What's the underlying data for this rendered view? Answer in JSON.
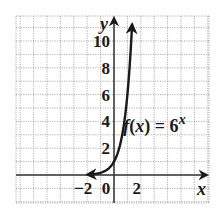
{
  "chart_data": {
    "type": "line",
    "title": "",
    "xlabel": "x",
    "ylabel": "y",
    "xlim": [
      -7.3,
      7.1
    ],
    "ylim": [
      -2.1,
      11.9
    ],
    "grid": true,
    "x_ticks": [
      {
        "value": -2,
        "label": "−2"
      },
      {
        "value": 0,
        "label": "0"
      },
      {
        "value": 2,
        "label": "2"
      }
    ],
    "y_ticks": [
      {
        "value": 2,
        "label": "2"
      },
      {
        "value": 4,
        "label": "4"
      },
      {
        "value": 6,
        "label": "6"
      },
      {
        "value": 8,
        "label": "8"
      },
      {
        "value": 10,
        "label": "10"
      }
    ],
    "series": [
      {
        "name": "f(x) = 6^x",
        "function": "6^x",
        "x": [
          -2,
          -1.5,
          -1,
          -0.5,
          0,
          0.25,
          0.5,
          0.75,
          1,
          1.1,
          1.2,
          1.3,
          1.35
        ],
        "y": [
          0.028,
          0.068,
          0.167,
          0.408,
          1,
          1.565,
          2.449,
          3.834,
          6,
          7.18,
          8.59,
          10.27,
          11.24
        ],
        "arrow_both_ends": true
      }
    ],
    "annotations": [
      {
        "text_parts": [
          {
            "t": "f",
            "italic": true
          },
          {
            "t": "(",
            "italic": false
          },
          {
            "t": "x",
            "italic": true
          },
          {
            "t": ") = 6",
            "italic": false
          }
        ],
        "superscript": "x",
        "anchor_x": 0.4,
        "anchor_y": 3.5
      }
    ]
  }
}
